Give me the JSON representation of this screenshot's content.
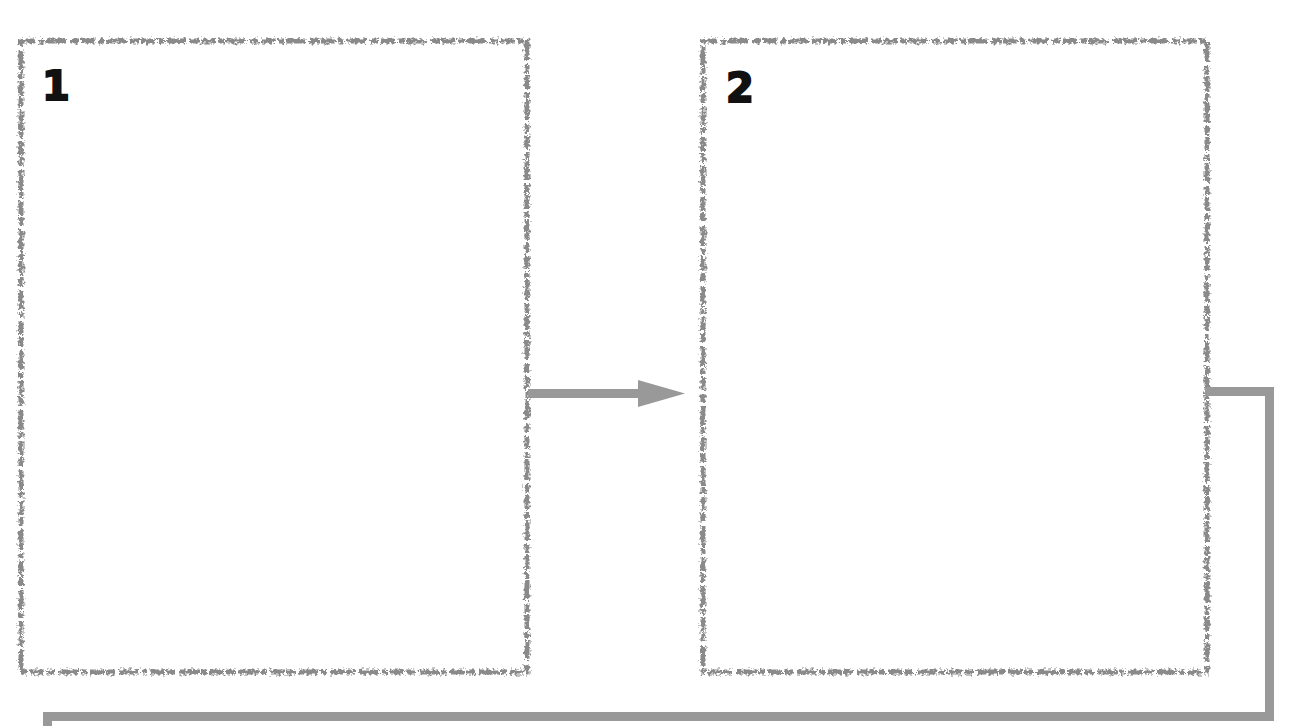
{
  "diagram": {
    "type": "process-flow",
    "colors": {
      "border": "#8a8a8a",
      "connector": "#999999",
      "number": "#111111",
      "background": "#ffffff"
    },
    "frames": [
      {
        "id": "frame-1",
        "number": "1",
        "content": ""
      },
      {
        "id": "frame-2",
        "number": "2",
        "content": ""
      }
    ],
    "connectors": [
      {
        "from": "frame-1",
        "to": "frame-2",
        "style": "arrow"
      },
      {
        "from": "frame-2",
        "to": "next-row",
        "style": "elbow-line"
      }
    ]
  }
}
